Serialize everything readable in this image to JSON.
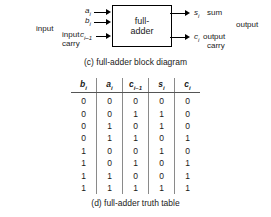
{
  "figure": {
    "block_diagram": {
      "block_label_line1": "full-",
      "block_label_line2": "adder",
      "inputs": [
        {
          "name": "a-input",
          "symbol": "a",
          "sub": "i"
        },
        {
          "name": "b-input",
          "symbol": "b",
          "sub": "i"
        },
        {
          "name": "carry-in",
          "symbol": "c",
          "sub": "i–1"
        }
      ],
      "outputs": [
        {
          "name": "sum-output",
          "symbol": "s",
          "sub": "i",
          "text": "sum"
        },
        {
          "name": "carry-out-output",
          "symbol": "c",
          "sub": "i",
          "text": "output"
        }
      ],
      "left_group_label": "input",
      "input_carry_line1": "input",
      "input_carry_line2": "carry",
      "right_group_label": "output",
      "output_carry_line2": "carry",
      "caption": "(c) full-adder block diagram"
    },
    "truth_table": {
      "caption": "(d) full-adder truth table",
      "headers": [
        {
          "symbol": "b",
          "sub": "i"
        },
        {
          "symbol": "a",
          "sub": "i"
        },
        {
          "symbol": "c",
          "sub": "i–1"
        },
        {
          "symbol": "s",
          "sub": "i"
        },
        {
          "symbol": "c",
          "sub": "i"
        }
      ],
      "rows": [
        [
          "0",
          "0",
          "0",
          "0",
          "0"
        ],
        [
          "0",
          "0",
          "1",
          "1",
          "0"
        ],
        [
          "0",
          "1",
          "0",
          "1",
          "0"
        ],
        [
          "0",
          "1",
          "1",
          "0",
          "1"
        ],
        [
          "1",
          "0",
          "0",
          "1",
          "0"
        ],
        [
          "1",
          "0",
          "1",
          "0",
          "1"
        ],
        [
          "1",
          "1",
          "0",
          "0",
          "1"
        ],
        [
          "1",
          "1",
          "1",
          "1",
          "1"
        ]
      ]
    }
  },
  "colors": {
    "ink": "#1a1a1a",
    "rule": "#8a8a8a",
    "background": "#ffffff"
  }
}
